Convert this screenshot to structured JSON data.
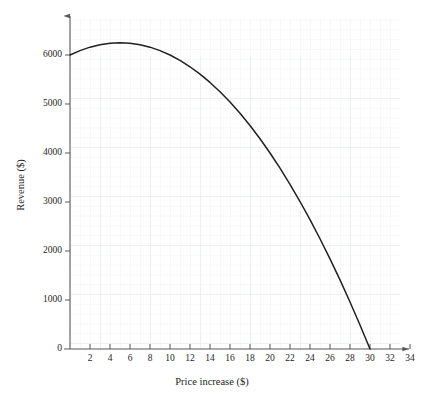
{
  "chart_data": {
    "type": "line",
    "title": "",
    "subtitle": "",
    "xlabel": "Price increase ($)",
    "ylabel": "Revenue ($)",
    "xlim": [
      0,
      35.5
    ],
    "ylim": [
      0,
      6800
    ],
    "xticks": [
      2,
      4,
      6,
      8,
      10,
      12,
      14,
      16,
      18,
      20,
      22,
      24,
      26,
      28,
      30,
      32,
      34
    ],
    "xtick_labels": [
      "2",
      "4",
      "6",
      "8",
      "10",
      "12",
      "14",
      "16",
      "18",
      "20",
      "22",
      "24",
      "26",
      "28",
      "30",
      "32",
      "34"
    ],
    "yticks": [
      0,
      1000,
      2000,
      3000,
      4000,
      5000,
      6000
    ],
    "ytick_labels": [
      "0",
      "1000",
      "2000",
      "3000",
      "4000",
      "5000",
      "6000"
    ],
    "origin_label": "0",
    "grid": true,
    "grid_minor_step_x": 1,
    "grid_minor_step_y": 200,
    "grid_major_step_x": 5,
    "grid_major_step_y": 1000,
    "legend": null,
    "axis_arrows": true,
    "curve": {
      "name": "Revenue",
      "equation": "R = 10(x + 20)(30 - x)",
      "vertex": [
        5,
        6250
      ],
      "x_intercepts": [
        30
      ],
      "y_intercept": 6000,
      "x": [
        0,
        1,
        2,
        3,
        4,
        5,
        6,
        7,
        8,
        9,
        10,
        11,
        12,
        13,
        14,
        15,
        16,
        17,
        18,
        19,
        20,
        21,
        22,
        23,
        24,
        25,
        26,
        27,
        28,
        29,
        30
      ],
      "y": [
        6000,
        6090,
        6160,
        6210,
        6240,
        6250,
        6240,
        6210,
        6160,
        6090,
        6000,
        5890,
        5760,
        5610,
        5440,
        5250,
        5040,
        4810,
        4560,
        4290,
        4000,
        3690,
        3360,
        3010,
        2640,
        2250,
        1840,
        1410,
        960,
        490,
        0
      ]
    }
  },
  "colors": {
    "curve": "#231f20",
    "axis": "#58595b",
    "grid_minor": "#eef1f3",
    "grid_major": "#e2e7ea",
    "text": "#231f20",
    "background": "#ffffff"
  }
}
